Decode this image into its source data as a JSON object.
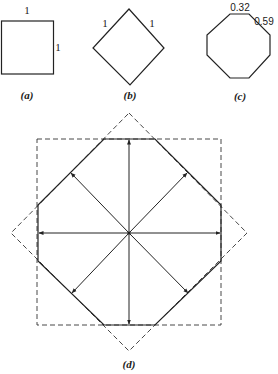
{
  "figure": {
    "panels": [
      {
        "id": "a",
        "caption": "(a)",
        "shape": "square",
        "labels": {
          "top": "1",
          "right": "1"
        }
      },
      {
        "id": "b",
        "caption": "(b)",
        "shape": "diamond",
        "labels": {
          "upper_left": "1",
          "upper_right": "1"
        }
      },
      {
        "id": "c",
        "caption": "(c)",
        "shape": "octagon",
        "labels": {
          "top": "0.32",
          "upper_right": "0.59"
        }
      },
      {
        "id": "d",
        "caption": "(d)",
        "shape": "octagon-with-dashed-square-and-diamond",
        "description": "Octagon formed by intersection of dashed square and dashed diamond, with eight arrows radiating from the center to the edges"
      }
    ]
  }
}
